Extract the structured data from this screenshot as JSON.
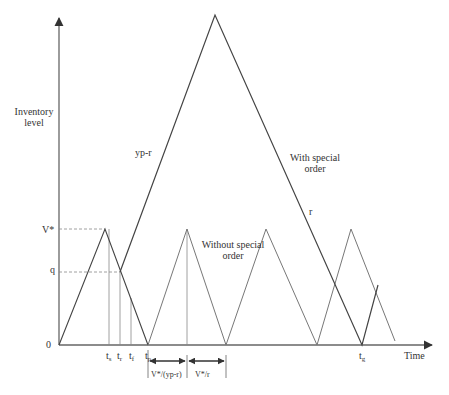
{
  "diagram": {
    "type": "inventory-level-time-diagram",
    "y_axis_label_line1": "Inventory",
    "y_axis_label_line2": "level",
    "x_axis_label": "Time",
    "origin_label": "0",
    "level_labels": {
      "v_star": "V*",
      "q": "q"
    },
    "time_labels": {
      "ts": "t",
      "ts_sub": "s",
      "tr": "t",
      "tr_sub": "r",
      "tf": "t",
      "tf_sub": "f",
      "tp": "t",
      "tp_sub": "p",
      "tg": "t",
      "tg_sub": "g"
    },
    "slope_labels": {
      "up": "yp-r",
      "down": "r"
    },
    "series_labels": {
      "with_line1": "With special",
      "with_line2": "order",
      "without_line1": "Without special",
      "without_line2": "order"
    },
    "interval_labels": {
      "first": "V*/(yp-r)",
      "second": "V*/r"
    },
    "colors": {
      "axis": "#555555",
      "special": "#444444",
      "regular": "#777777",
      "dashed": "#888888"
    }
  }
}
